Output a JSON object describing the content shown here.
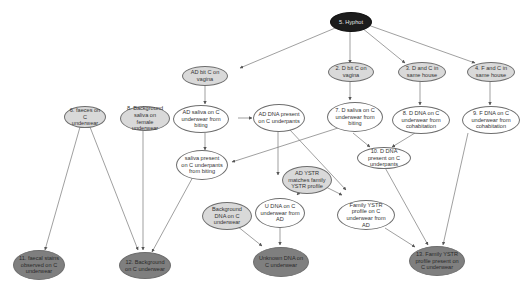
{
  "diagram": {
    "colors": {
      "root": "#1c1c1c",
      "evidence_light": "#d9d9d9",
      "inferred_white": "#ffffff",
      "outcome_dark": "#7f7f7f",
      "edge": "#777777"
    },
    "nodes": [
      {
        "id": "n5",
        "label": "5. Hyphot",
        "style": "black"
      },
      {
        "id": "n_ad_dc",
        "label": "AD bit C on vagina",
        "style": "light"
      },
      {
        "id": "n2",
        "label": "2. D bit C on vagina",
        "style": "light"
      },
      {
        "id": "n3",
        "label": "3. D and C in same house",
        "style": "light"
      },
      {
        "id": "n4",
        "label": "4. F and C in same house",
        "style": "light"
      },
      {
        "id": "n6",
        "label": "6. faeces on C underwear",
        "style": "light"
      },
      {
        "id": "n8",
        "label": "8. Background saliva on female underwear",
        "style": "light"
      },
      {
        "id": "n_ad_saliva",
        "label": "AD saliva on C underwear from biting",
        "style": "white"
      },
      {
        "id": "n_ad_dna",
        "label": "AD DNA present on C underpants",
        "style": "white"
      },
      {
        "id": "n7",
        "label": "7. D saliva on C underwear from biting",
        "style": "white"
      },
      {
        "id": "n8d",
        "label": "8. D DNA on C underwear from cohabitation",
        "style": "white"
      },
      {
        "id": "n9",
        "label": "9. F DNA on C underwear from cohabitation",
        "style": "white"
      },
      {
        "id": "n10",
        "label": "10. D DNA present on C underpants",
        "style": "white"
      },
      {
        "id": "n_saliva_present",
        "label": "saliva present on C underpants from biting",
        "style": "white"
      },
      {
        "id": "n_ad_ystr",
        "label": "AD YSTR matches family YSTR profile",
        "style": "light"
      },
      {
        "id": "n_bg_dna",
        "label": "Background DNA on C underwear",
        "style": "light"
      },
      {
        "id": "n_u_dna",
        "label": "U DNA on C underwear from AD",
        "style": "white"
      },
      {
        "id": "n_family_ystr",
        "label": "Family YSTR profile on C underwear from AD",
        "style": "white"
      },
      {
        "id": "n11",
        "label": "11. faecal stains observed on C underwear",
        "style": "dark"
      },
      {
        "id": "n12",
        "label": "12. Background on C underwear",
        "style": "dark"
      },
      {
        "id": "n_unknown",
        "label": "Unknown DNA on C underwear",
        "style": "dark"
      },
      {
        "id": "n13",
        "label": "13. Family YSTR profile present on C underwear",
        "style": "dark"
      }
    ],
    "edges": [
      [
        "n5",
        "n_ad_dc"
      ],
      [
        "n5",
        "n2"
      ],
      [
        "n5",
        "n3"
      ],
      [
        "n5",
        "n4"
      ],
      [
        "n_ad_dc",
        "n_ad_saliva"
      ],
      [
        "n_ad_saliva",
        "n_ad_dna"
      ],
      [
        "n_ad_saliva",
        "n_saliva_present"
      ],
      [
        "n2",
        "n7"
      ],
      [
        "n3",
        "n8d"
      ],
      [
        "n4",
        "n9"
      ],
      [
        "n7",
        "n10"
      ],
      [
        "n8d",
        "n10"
      ],
      [
        "n7",
        "n_saliva_present"
      ],
      [
        "n_ad_dna",
        "n_u_dna"
      ],
      [
        "n_ad_dna",
        "n_family_ystr"
      ],
      [
        "n_ad_ystr",
        "n_u_dna"
      ],
      [
        "n_ad_ystr",
        "n_family_ystr"
      ],
      [
        "n6",
        "n11"
      ],
      [
        "n6",
        "n12"
      ],
      [
        "n8",
        "n12"
      ],
      [
        "n_saliva_present",
        "n12"
      ],
      [
        "n_bg_dna",
        "n_unknown"
      ],
      [
        "n_u_dna",
        "n_unknown"
      ],
      [
        "n10",
        "n13"
      ],
      [
        "n9",
        "n13"
      ],
      [
        "n_family_ystr",
        "n13"
      ]
    ]
  }
}
